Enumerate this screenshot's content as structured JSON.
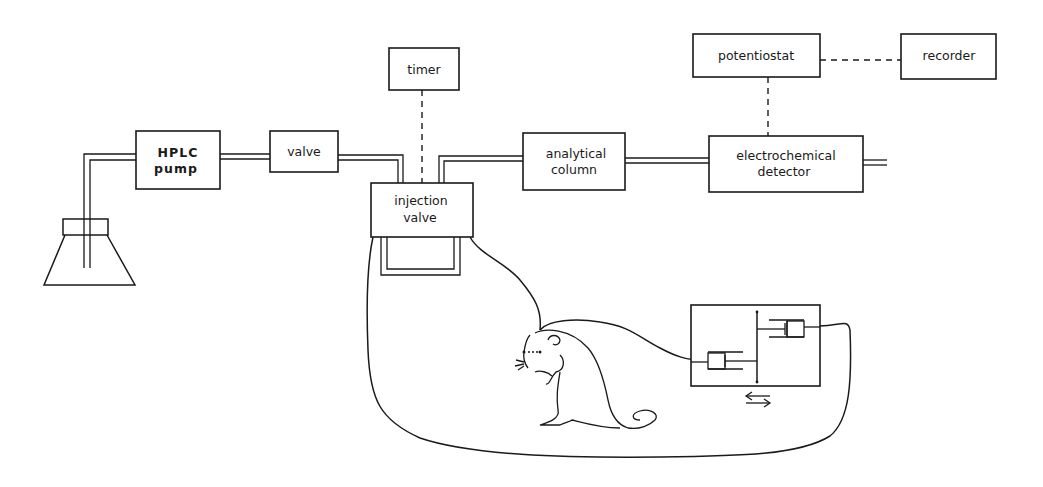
{
  "diagram": {
    "type": "block-flow-schematic",
    "colors": {
      "ink": "#1a1a1a",
      "background": "#ffffff"
    },
    "components": {
      "hplc_pump": {
        "line1": "HPLC",
        "line2": "pump"
      },
      "valve": {
        "label": "valve"
      },
      "timer": {
        "label": "timer"
      },
      "injection_valve": {
        "line1": "injection",
        "line2": "valve"
      },
      "analytical_column": {
        "line1": "analytical",
        "line2": "column"
      },
      "potentiostat": {
        "label": "potentiostat"
      },
      "recorder": {
        "label": "recorder"
      },
      "electrochemical_detector": {
        "line1": "electrochemical",
        "line2": "detector"
      },
      "solvent_flask": {
        "icon": "erlenmeyer-flask-icon"
      },
      "animal": {
        "icon": "rat-icon"
      },
      "syringe_pump": {
        "icon": "dual-syringe-pump-icon",
        "direction_symbol": "⇆"
      }
    },
    "connections": [
      {
        "from": "solvent_flask",
        "to": "hplc_pump",
        "style": "tubing"
      },
      {
        "from": "hplc_pump",
        "to": "valve",
        "style": "tubing"
      },
      {
        "from": "valve",
        "to": "injection_valve",
        "style": "tubing"
      },
      {
        "from": "injection_valve",
        "to": "analytical_column",
        "style": "tubing"
      },
      {
        "from": "analytical_column",
        "to": "electrochemical_detector",
        "style": "tubing"
      },
      {
        "from": "timer",
        "to": "injection_valve",
        "style": "dashed-signal"
      },
      {
        "from": "potentiostat",
        "to": "electrochemical_detector",
        "style": "dashed-signal"
      },
      {
        "from": "potentiostat",
        "to": "recorder",
        "style": "dashed-signal"
      },
      {
        "from": "injection_valve",
        "to": "animal",
        "style": "probe-line"
      },
      {
        "from": "animal",
        "to": "syringe_pump",
        "style": "probe-line"
      },
      {
        "from": "syringe_pump",
        "to": "injection_valve",
        "style": "return-loop"
      }
    ]
  }
}
